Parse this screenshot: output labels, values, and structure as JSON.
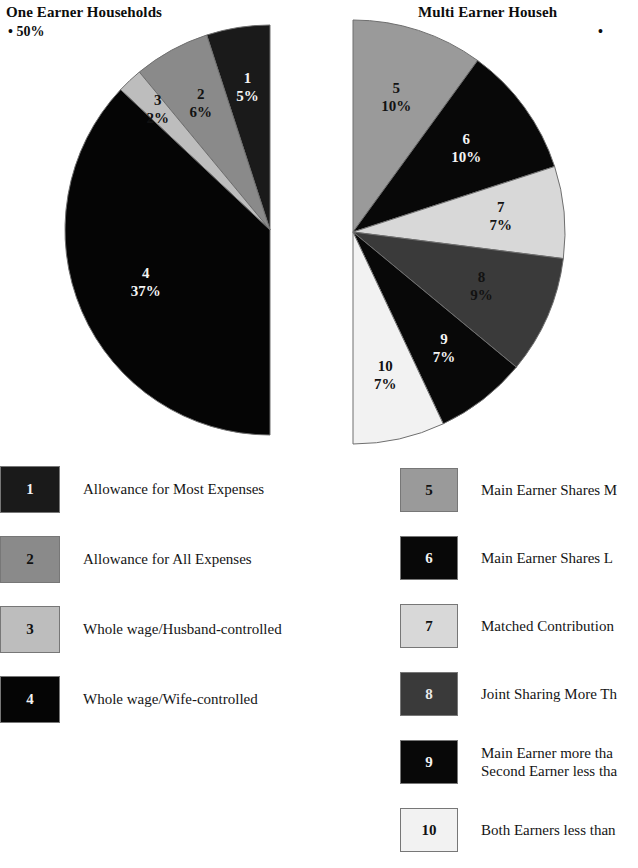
{
  "panels": [
    {
      "title": "One Earner Households",
      "bullet": "• 50%",
      "share_total": "50%"
    },
    {
      "title": "Multi Earner Househ",
      "bullet": "•",
      "share_total": "50%"
    }
  ],
  "legend_left": {
    "items": [
      {
        "num": "1",
        "label": "Allowance for Most Expenses",
        "color": "#1a1a1a",
        "num_color": "#f2f2f2"
      },
      {
        "num": "2",
        "label": "Allowance for All Expenses",
        "color": "#8a8a8a",
        "num_color": "#111111"
      },
      {
        "num": "3",
        "label": "Whole wage/Husband-controlled",
        "color": "#bdbdbd",
        "num_color": "#111111"
      },
      {
        "num": "4",
        "label": "Whole wage/Wife-controlled",
        "color": "#050505",
        "num_color": "#f2f2f2"
      }
    ]
  },
  "legend_right": {
    "items": [
      {
        "num": "5",
        "label": "Main Earner Shares M",
        "label2": "",
        "color": "#9a9a9a",
        "num_color": "#111111"
      },
      {
        "num": "6",
        "label": "Main Earner Shares L",
        "label2": "",
        "color": "#080808",
        "num_color": "#f2f2f2"
      },
      {
        "num": "7",
        "label": "Matched Contribution",
        "label2": "",
        "color": "#d8d8d8",
        "num_color": "#111111"
      },
      {
        "num": "8",
        "label": "Joint Sharing More Th",
        "label2": "",
        "color": "#3a3a3a",
        "num_color": "#e8e8e8"
      },
      {
        "num": "9",
        "label": "Main Earner more tha",
        "label2": "Second Earner less tha",
        "color": "#080808",
        "num_color": "#f2f2f2"
      },
      {
        "num": "10",
        "label": "Both Earners less than",
        "label2": "",
        "color": "#f2f2f2",
        "num_color": "#111111"
      }
    ]
  },
  "chart_data": [
    {
      "type": "pie",
      "title": "One Earner Households",
      "subtitle": "• 50%",
      "half_pie": true,
      "total_percent": 50,
      "start_angle_deg": 0,
      "sweep_direction": "counterclockwise-from-top",
      "categories": [
        "Allowance for Most Expenses",
        "Allowance for All Expenses",
        "Whole wage/Husband-controlled",
        "Whole wage/Wife-controlled"
      ],
      "labels": [
        "1",
        "2",
        "3",
        "4"
      ],
      "values": [
        5,
        6,
        2,
        37
      ],
      "value_labels": [
        "5%",
        "6%",
        "2%",
        "37%"
      ],
      "colors": [
        "#1a1a1a",
        "#8a8a8a",
        "#bdbdbd",
        "#050505"
      ],
      "label_text_colors": [
        "#f4f4f4",
        "#121212",
        "#121212",
        "#f4f4f4"
      ],
      "unit": "%",
      "legend_position": "below"
    },
    {
      "type": "pie",
      "title": "Multi Earner Househ",
      "subtitle": "•",
      "half_pie": true,
      "total_percent": 50,
      "start_angle_deg": 0,
      "sweep_direction": "clockwise-from-top",
      "categories": [
        "Main Earner Shares M",
        "Main Earner Shares L",
        "Matched Contribution",
        "Joint Sharing More Th",
        "Main Earner more tha / Second Earner less tha",
        "Both Earners less than"
      ],
      "labels": [
        "5",
        "6",
        "7",
        "8",
        "9",
        "10"
      ],
      "values": [
        10,
        10,
        7,
        9,
        7,
        7
      ],
      "value_labels": [
        "10%",
        "10%",
        "7%",
        "9%",
        "7%",
        "7%"
      ],
      "colors": [
        "#9a9a9a",
        "#080808",
        "#d8d8d8",
        "#3a3a3a",
        "#080808",
        "#f2f2f2"
      ],
      "label_text_colors": [
        "#121212",
        "#f4f4f4",
        "#121212",
        "#121212",
        "#f4f4f4",
        "#121212"
      ],
      "unit": "%",
      "legend_position": "below"
    }
  ]
}
